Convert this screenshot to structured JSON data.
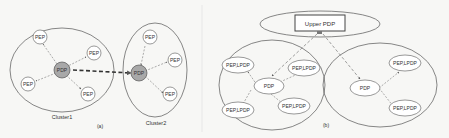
{
  "panel_a": {
    "caption": "(a)",
    "cluster1": {
      "label": "Cluster1",
      "pdp": "PDP",
      "peps": [
        "PEP",
        "PEP",
        "PEP",
        "PEP"
      ]
    },
    "cluster2": {
      "label": "Cluster2",
      "pdp": "PDP",
      "peps": [
        "PEP",
        "PEP",
        "PEP"
      ]
    }
  },
  "panel_b": {
    "caption": "(b)",
    "upper_pdp": "Upper PDP",
    "cluster_left": {
      "pdp": "PDP",
      "nodes": [
        "PEP,LPDP",
        "PEP,LPDP",
        "PEP,LPDP",
        "PEP,LPDP"
      ]
    },
    "cluster_right": {
      "pdp": "PDP",
      "nodes": [
        "PEP,LPDP",
        "PEP,LPDP"
      ]
    }
  },
  "colors": {
    "stroke": "#555555",
    "pdp_fill": "#a8a8a8",
    "node_fill": "#ffffff",
    "dashed": "#666666"
  }
}
